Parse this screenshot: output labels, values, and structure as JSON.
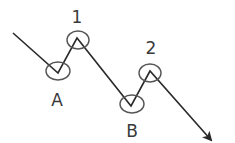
{
  "diagram": {
    "type": "zigzag-wave",
    "colors": {
      "line": "#2a2a2a",
      "circle": "#555555",
      "label": "#3a3a3a",
      "background": "#ffffff"
    },
    "path_points": [
      {
        "x": 13,
        "y": 33
      },
      {
        "x": 58,
        "y": 73
      },
      {
        "x": 77,
        "y": 38
      },
      {
        "x": 131,
        "y": 106
      },
      {
        "x": 150,
        "y": 71
      },
      {
        "x": 211,
        "y": 140
      }
    ],
    "points": [
      {
        "id": "A",
        "label": "A",
        "kind": "trough",
        "cx": 58,
        "cy": 71,
        "rx": 12,
        "ry": 9,
        "label_x": 57,
        "label_y": 106
      },
      {
        "id": "1",
        "label": "1",
        "kind": "peak",
        "cx": 78,
        "cy": 40,
        "rx": 11,
        "ry": 9,
        "label_x": 77,
        "label_y": 23
      },
      {
        "id": "B",
        "label": "B",
        "kind": "trough",
        "cx": 132,
        "cy": 104,
        "rx": 12,
        "ry": 9,
        "label_x": 132,
        "label_y": 137
      },
      {
        "id": "2",
        "label": "2",
        "kind": "peak",
        "cx": 150,
        "cy": 73,
        "rx": 11,
        "ry": 9,
        "label_x": 151,
        "label_y": 54
      }
    ],
    "arrow": {
      "direction": "down-right",
      "tip_x": 211,
      "tip_y": 140
    }
  }
}
